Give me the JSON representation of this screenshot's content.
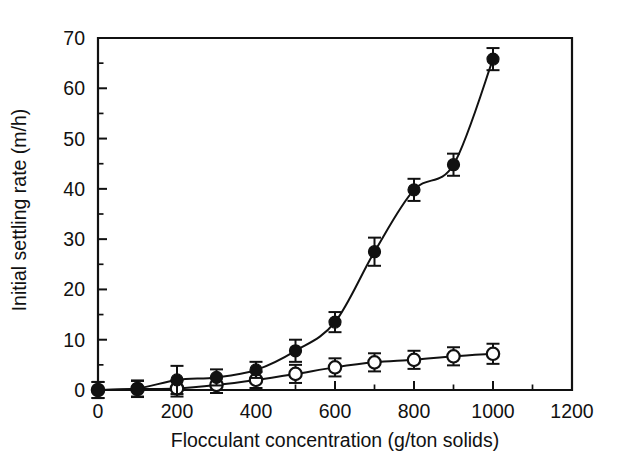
{
  "chart_data": {
    "type": "scatter",
    "title": "",
    "xlabel": "Flocculant concentration (g/ton solids)",
    "ylabel": "Initial settling rate (m/h)",
    "xlim": [
      0,
      1200
    ],
    "ylim": [
      0,
      70
    ],
    "x_major_ticks": [
      0,
      200,
      400,
      600,
      800,
      1000,
      1200
    ],
    "x_minor_ticks": [
      100,
      300,
      500,
      700,
      900,
      1100
    ],
    "y_major_ticks": [
      0,
      10,
      20,
      30,
      40,
      50,
      60,
      70
    ],
    "y_minor_ticks": [
      5,
      15,
      25,
      35,
      45,
      55,
      65
    ],
    "x_tick_labels": [
      "0",
      "200",
      "400",
      "600",
      "800",
      "1000",
      "1200"
    ],
    "y_tick_labels": [
      "0",
      "10",
      "20",
      "30",
      "40",
      "50",
      "60",
      "70"
    ],
    "grid": false,
    "legend": "none",
    "marker_colors": {
      "filled": "#111111",
      "open": "#ffffff",
      "outline": "#111111"
    },
    "series": [
      {
        "name": "filled-circles",
        "marker": "filled-circle",
        "x": [
          0,
          100,
          200,
          300,
          400,
          500,
          600,
          700,
          800,
          900,
          1000
        ],
        "values": [
          0.0,
          0.3,
          2.0,
          2.5,
          4.0,
          7.8,
          13.5,
          27.5,
          39.8,
          44.8,
          65.8
        ],
        "yerr": [
          1.6,
          1.6,
          2.8,
          1.6,
          1.6,
          2.2,
          2.0,
          2.8,
          2.2,
          2.2,
          2.2
        ],
        "fit_curve": true
      },
      {
        "name": "open-circles",
        "marker": "open-circle",
        "x": [
          0,
          100,
          200,
          300,
          400,
          500,
          600,
          700,
          800,
          900,
          1000
        ],
        "values": [
          0.0,
          0.2,
          0.3,
          1.0,
          2.0,
          3.2,
          4.5,
          5.5,
          6.0,
          6.7,
          7.2
        ],
        "yerr": [
          1.6,
          1.6,
          1.6,
          1.6,
          1.6,
          1.8,
          1.8,
          1.8,
          1.8,
          1.8,
          2.0
        ],
        "fit_curve": true
      }
    ]
  }
}
